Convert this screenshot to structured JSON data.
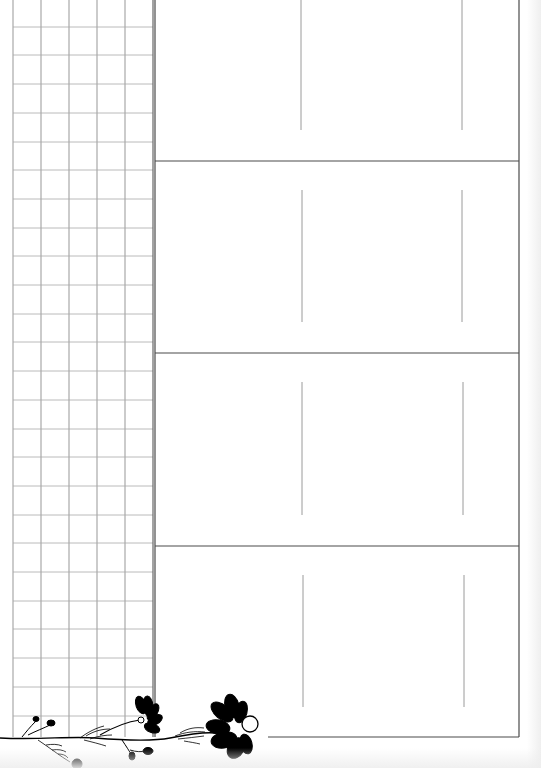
{
  "page": {
    "type": "printable-planner-sheet",
    "background_color": "#ffffff",
    "line_color_dark": "#4a4a4a",
    "line_color_light": "#9a9a9a",
    "grid_line_color": "#a8a8a8"
  },
  "grid": {
    "columns": 5,
    "rows": 26,
    "x_lines": [
      13,
      41,
      69,
      97,
      125,
      153
    ],
    "row_height": 28.7,
    "top": 0,
    "bottom": 737
  },
  "sections": [
    {
      "index": 1,
      "top": 0,
      "bottom": 161,
      "inner_lines": [
        {
          "x": 301,
          "y1": 0,
          "y2": 130
        },
        {
          "x": 462,
          "y1": 0,
          "y2": 130
        }
      ]
    },
    {
      "index": 2,
      "top": 161,
      "bottom": 353,
      "inner_lines": [
        {
          "x": 302,
          "y1": 190,
          "y2": 322
        },
        {
          "x": 462,
          "y1": 190,
          "y2": 322
        }
      ]
    },
    {
      "index": 3,
      "top": 353,
      "bottom": 546,
      "inner_lines": [
        {
          "x": 302,
          "y1": 382,
          "y2": 515
        },
        {
          "x": 463,
          "y1": 382,
          "y2": 515
        }
      ]
    },
    {
      "index": 4,
      "top": 546,
      "bottom": 737,
      "inner_lines": [
        {
          "x": 303,
          "y1": 575,
          "y2": 707
        },
        {
          "x": 464,
          "y1": 575,
          "y2": 707
        }
      ]
    }
  ],
  "frame": {
    "left": 155,
    "right": 519,
    "bottom": 737
  },
  "decoration": {
    "name": "black-flower-vine",
    "icons": [
      "flower-icon",
      "flower-icon",
      "leaf-sprig-icon",
      "bud-icon"
    ]
  }
}
